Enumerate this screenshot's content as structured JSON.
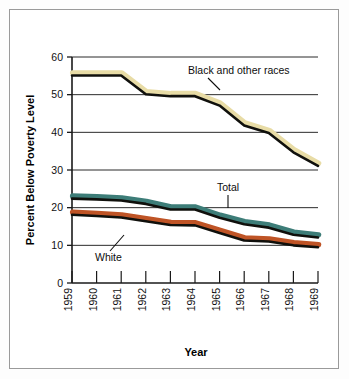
{
  "figure": {
    "background_color": "#ffffff",
    "border_color": "#9a9a9a"
  },
  "axis_titles": {
    "y": "Percent Below Poverty Level",
    "x": "Year"
  },
  "annotations": {
    "black_other": "Black and other races",
    "total": "Total",
    "white": "White"
  },
  "colors": {
    "black_other": "#e8dca6",
    "total": "#3d7d78",
    "white": "#bf5426",
    "line": "#10100c",
    "axis": "#1a1a1a",
    "grid": "#2b2b2b"
  },
  "chart_data": {
    "type": "line",
    "title": "",
    "xlabel": "Year",
    "ylabel": "Percent Below Poverty Level",
    "x": [
      1959,
      1960,
      1961,
      1962,
      1963,
      1964,
      1965,
      1966,
      1967,
      1968,
      1969
    ],
    "xtick_labels": [
      "1959",
      "1960",
      "1961",
      "1962",
      "1963",
      "1964",
      "1965",
      "1966",
      "1967",
      "1968",
      "1969"
    ],
    "ylim": [
      0,
      60
    ],
    "ytick_labels": [
      "0",
      "10",
      "20",
      "30",
      "40",
      "50",
      "60"
    ],
    "yticks": [
      0,
      10,
      20,
      30,
      40,
      50,
      60
    ],
    "grid": "horizontal",
    "legend_position": "inline-annotations",
    "series": [
      {
        "name": "Black and other races",
        "color": "#e8dca6",
        "values": [
          55.1,
          55.1,
          55.1,
          50.1,
          49.6,
          49.6,
          47.1,
          41.8,
          39.8,
          34.7,
          31.1
        ]
      },
      {
        "name": "Total",
        "color": "#3d7d78",
        "values": [
          22.4,
          22.2,
          21.9,
          21.0,
          19.5,
          19.5,
          17.3,
          15.6,
          14.7,
          12.8,
          12.1
        ]
      },
      {
        "name": "White",
        "color": "#bf5426",
        "values": [
          18.1,
          17.8,
          17.4,
          16.4,
          15.4,
          15.3,
          13.3,
          11.3,
          11.0,
          10.0,
          9.5
        ]
      }
    ]
  }
}
